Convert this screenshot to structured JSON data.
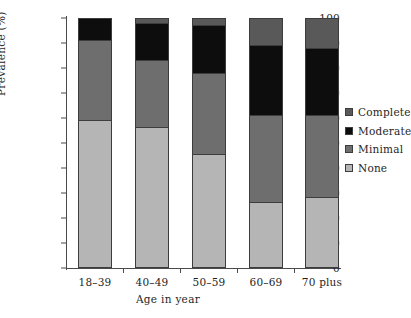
{
  "chart_data": {
    "type": "bar",
    "stacked": true,
    "title": "",
    "subtitle": "",
    "xlabel": "Age in year",
    "ylabel": "Prevalence (%)",
    "categories": [
      "18–39",
      "40–49",
      "50–59",
      "60–69",
      "70 plus"
    ],
    "ylim": [
      0,
      100
    ],
    "yticks": [
      0,
      10,
      20,
      30,
      40,
      50,
      60,
      70,
      80,
      90,
      100
    ],
    "ytick_labels": [
      "0",
      "10",
      "20",
      "30",
      "40",
      "50",
      "60",
      "70",
      "80",
      "90",
      "100"
    ],
    "grid": false,
    "legend_position": "right",
    "stack_order_bottom_to_top": [
      "None",
      "Minimal",
      "Moderate",
      "Complete"
    ],
    "series": [
      {
        "name": "None",
        "color": "#b5b5b5",
        "values": [
          59,
          56,
          45,
          26,
          28
        ]
      },
      {
        "name": "Minimal",
        "color": "#6e6e6e",
        "values": [
          32,
          27,
          33,
          35,
          33
        ]
      },
      {
        "name": "Moderate",
        "color": "#0d0d0d",
        "values": [
          9,
          15,
          19,
          28,
          27
        ]
      },
      {
        "name": "Complete",
        "color": "#595959",
        "values": [
          0,
          2,
          3,
          11,
          12
        ]
      }
    ],
    "cumulative_tops": {
      "None": [
        59,
        56,
        45,
        26,
        28
      ],
      "Minimal": [
        91,
        83,
        78,
        61,
        61
      ],
      "Moderate": [
        100,
        98,
        97,
        89,
        88
      ],
      "Complete": [
        100,
        100,
        100,
        100,
        100
      ]
    }
  },
  "legend": {
    "items": [
      {
        "label": "Complete",
        "color": "#595959",
        "icon": "square-swatch-icon"
      },
      {
        "label": "Moderate",
        "color": "#0d0d0d",
        "icon": "square-swatch-icon"
      },
      {
        "label": "Minimal",
        "color": "#6e6e6e",
        "icon": "square-swatch-icon"
      },
      {
        "label": "None",
        "color": "#b5b5b5",
        "icon": "square-swatch-icon"
      }
    ]
  },
  "axes": {
    "y_title": "Prevalence (%)",
    "x_title": "Age in year"
  }
}
